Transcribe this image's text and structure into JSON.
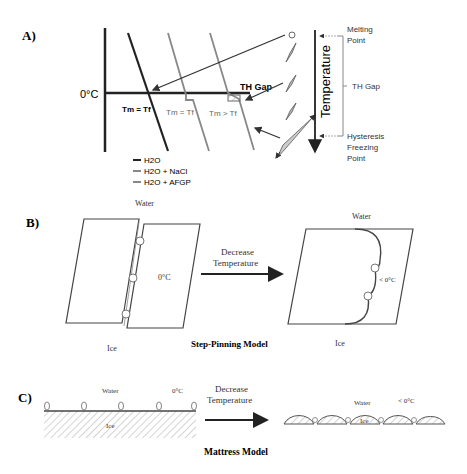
{
  "panel_a": {
    "label": "A)",
    "zero_label": "0°C",
    "eq1": "Tm = Tf",
    "eq2": "Tm = Tf",
    "eq3": "Tm > Tf",
    "th_gap_label": "TH Gap",
    "temperature_axis": "Temperature",
    "melting_point": [
      "Melting",
      "Point"
    ],
    "th_gap_bracket": "TH Gap",
    "hysteresis": [
      "Hysteresis",
      "Freezing",
      "Point"
    ],
    "legend": [
      {
        "label": "H2O",
        "color": "#222222"
      },
      {
        "label": "H2O + NaCl",
        "color": "#888888"
      },
      {
        "label": "H2O + AFGP",
        "color": "#888888"
      }
    ]
  },
  "panel_b": {
    "label": "B)",
    "water_left": "Water",
    "zero_label": "0°C",
    "ice_left": "Ice",
    "arrow_text": [
      "Decrease",
      "Temperature"
    ],
    "water_right": "Water",
    "below_zero": "< 0°C",
    "ice_right": "Ice",
    "model_title": "Step-Pinning  Model"
  },
  "panel_c": {
    "label": "C)",
    "water_left": "Water",
    "zero_label": "0°C",
    "ice_left": "Ice",
    "arrow_text": [
      "Decrease",
      "Temperature"
    ],
    "water_right": "Water",
    "below_zero": "< 0°C",
    "ice_right": "Ice",
    "model_title": "Mattress Model"
  }
}
